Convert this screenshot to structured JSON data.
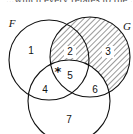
{
  "caption_fragment": "...which every relates to the ...",
  "sets": [
    {
      "name": "F",
      "cx": 49,
      "cy": 60,
      "r": 40
    },
    {
      "name": "G",
      "cx": 90,
      "cy": 57,
      "r": 40
    },
    {
      "name": "",
      "cx": 69,
      "cy": 101,
      "r": 41
    }
  ],
  "set_labels": {
    "F": "F",
    "G": "G"
  },
  "regions": [
    {
      "id": "1",
      "label": "1",
      "x": 31,
      "y": 51
    },
    {
      "id": "2",
      "label": "2",
      "x": 70,
      "y": 52
    },
    {
      "id": "3",
      "label": "3",
      "x": 108,
      "y": 52
    },
    {
      "id": "4",
      "label": "4",
      "x": 45,
      "y": 90
    },
    {
      "id": "5",
      "label": "5",
      "x": 70,
      "y": 76
    },
    {
      "id": "6",
      "label": "6",
      "x": 95,
      "y": 90
    },
    {
      "id": "7",
      "label": "7",
      "x": 69,
      "y": 120
    }
  ],
  "marker": {
    "symbol": "*",
    "x": 58,
    "y": 71
  },
  "shaded_regions": [
    "2",
    "3"
  ],
  "colors": {
    "stroke": "#111111",
    "hatch": "#555555",
    "background": "#ffffff"
  }
}
